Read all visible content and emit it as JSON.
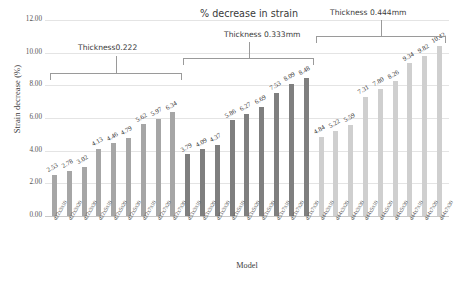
{
  "chart_data": {
    "type": "bar",
    "title": "% decrease in strain",
    "xlabel": "Model",
    "ylabel": "Strain decrease (%)",
    "ylim": [
      0,
      12
    ],
    "ytick_step": 2,
    "ytick_labels": [
      "0.00",
      "2.00",
      "4.00",
      "6.00",
      "8.00",
      "10.00",
      "12.00"
    ],
    "grid": true,
    "legend": "none",
    "categories": [
      "d22x3x10",
      "d22x3x20",
      "d22x3x30",
      "d22x5x10",
      "d22x5x20",
      "d22x5x30",
      "d22x7x10",
      "d22x7x20",
      "d22x7x30",
      "d33x3x10",
      "d33x3x20",
      "d33x3x30",
      "d33x5x10",
      "d33x5x20",
      "d33x5x30",
      "d33x7x10",
      "d33x7x20",
      "d33x7x30",
      "d44x3x10",
      "d44x3x20",
      "d44x3x30",
      "d44x5x10",
      "d44x5x20",
      "d44x5x30",
      "d44x7x10",
      "d44x7x20",
      "d44x7x30"
    ],
    "values": [
      2.53,
      2.78,
      3.02,
      4.13,
      4.46,
      4.79,
      5.62,
      5.97,
      6.34,
      3.79,
      4.09,
      4.37,
      5.86,
      6.27,
      6.69,
      7.53,
      8.09,
      8.48,
      4.84,
      5.22,
      5.59,
      7.31,
      7.8,
      8.26,
      9.34,
      9.82,
      10.42
    ],
    "value_labels": [
      "2.53",
      "2.78",
      "3.02",
      "4.13",
      "4.46",
      "4.79",
      "5.62",
      "5.97",
      "6.34",
      "3.79",
      "4.09",
      "4.37",
      "5.86",
      "6.27",
      "6.69",
      "7.53",
      "8.09",
      "8.48",
      "4.84",
      "5.22",
      "5.59",
      "7.31",
      "7.80",
      "8.26",
      "9.34",
      "9.82",
      "10.42"
    ],
    "groups": [
      {
        "label": "Thickness0.222",
        "start": 0,
        "end": 8,
        "color": "#a6a6a6"
      },
      {
        "label": "Thickness 0.333mm",
        "start": 9,
        "end": 17,
        "color": "#7f7f7f"
      },
      {
        "label": "Thickness 0.444mm",
        "start": 18,
        "end": 26,
        "color": "#cfcfcf"
      }
    ]
  },
  "annotations": {
    "title": "% decrease in strain",
    "group1_label": "Thickness0.222",
    "group2_label": "Thickness 0.333mm",
    "group3_label": "Thickness 0.444mm"
  }
}
